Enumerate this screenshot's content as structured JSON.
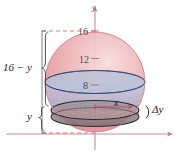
{
  "figure": {
    "type": "math-diagram",
    "axes": {
      "y_axis_label": "y",
      "x_axis_arrow": true,
      "y_axis_arrow": true
    },
    "tick_labels": [
      {
        "value": "16",
        "name": "tick-16"
      },
      {
        "value": "12",
        "name": "tick-12"
      },
      {
        "value": "8",
        "name": "tick-8"
      }
    ],
    "annotations": {
      "upper_bracket": "16 − y",
      "lower_bracket": "y",
      "slab_thickness": "Δy",
      "radius": "x"
    },
    "colors": {
      "sphere_pink": "#e8a0a4",
      "sphere_pink_light": "#f3c9cb",
      "band_blue": "#b9c4dd",
      "band_blue_edge": "#3c4a74",
      "disk_gray": "#9a9298",
      "disk_gray_edge": "#2e2b2e",
      "axis_red": "#c77f86",
      "bracket_gray": "#6a6a6a",
      "text_dark": "#1b1b1b"
    }
  }
}
